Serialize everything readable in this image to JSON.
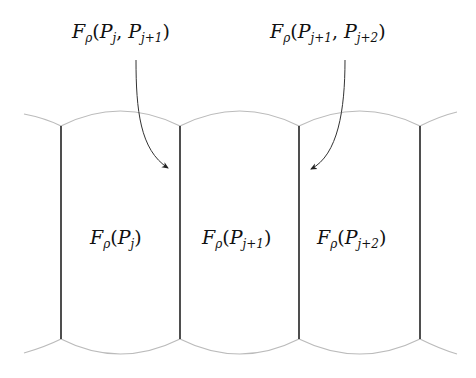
{
  "diagram": {
    "type": "cell-partition",
    "annotations": [
      {
        "id": "flux-j-j1",
        "F": "F",
        "rho": "ρ",
        "open": "(",
        "P1": "P",
        "s1": "j",
        "comma": ", ",
        "P2": "P",
        "s2": "j+1",
        "close": ")",
        "text": "Fρ(Pj, Pj+1)",
        "points_to": "boundary between cell j and j+1"
      },
      {
        "id": "flux-j1-j2",
        "F": "F",
        "rho": "ρ",
        "open": "(",
        "P1": "P",
        "s1": "j+1",
        "comma": ", ",
        "P2": "P",
        "s2": "j+2",
        "close": ")",
        "text": "Fρ(Pj+1, Pj+2)",
        "points_to": "boundary between cell j+1 and j+2"
      }
    ],
    "cells": [
      {
        "id": "cell-j",
        "F": "F",
        "rho": "ρ",
        "P": "P",
        "s": "j",
        "text": "Fρ(Pj)"
      },
      {
        "id": "cell-j1",
        "F": "F",
        "rho": "ρ",
        "P": "P",
        "s": "j+1",
        "text": "Fρ(Pj+1)"
      },
      {
        "id": "cell-j2",
        "F": "F",
        "rho": "ρ",
        "P": "P",
        "s": "j+2",
        "text": "Fρ(Pj+2)"
      }
    ],
    "colors": {
      "boundary_lines": "#222222",
      "arcs": "#bbbbbb",
      "arrows": "#333333",
      "background": "#ffffff"
    }
  }
}
